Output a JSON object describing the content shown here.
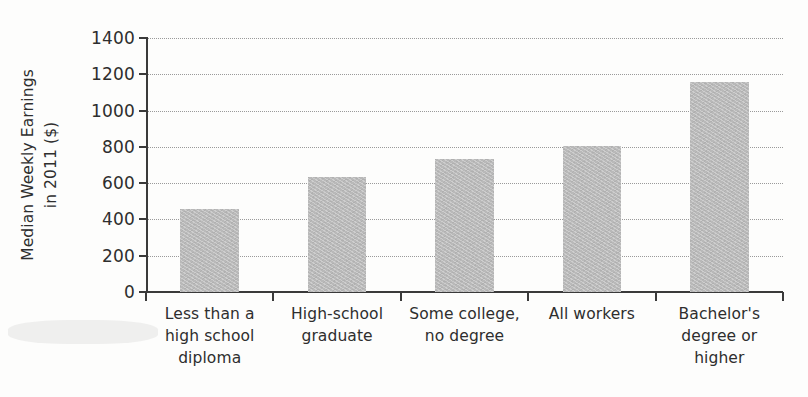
{
  "chart_data": {
    "type": "bar",
    "title": "",
    "subtitle": "",
    "xlabel": "",
    "ylabel": "Median Weekly Earnings in 2011 ($)",
    "ylabel_lines": [
      "Median Weekly Earnings",
      "in 2011 ($)"
    ],
    "categories": [
      "Less than a high school diploma",
      "High-school graduate",
      "Some college, no degree",
      "All workers",
      "Bachelor's degree or higher"
    ],
    "category_label_lines": [
      [
        "Less than a",
        "high school",
        "diploma"
      ],
      [
        "High-school",
        "graduate"
      ],
      [
        "Some college,",
        "no degree"
      ],
      [
        "All workers"
      ],
      [
        "Bachelor's",
        "degree or",
        "higher"
      ]
    ],
    "values": [
      460,
      635,
      735,
      805,
      1160
    ],
    "ylim": [
      0,
      1400
    ],
    "yticks": [
      0,
      200,
      400,
      600,
      800,
      1000,
      1200,
      1400
    ],
    "ytick_labels": [
      "0",
      "200",
      "400",
      "600",
      "800",
      "1000",
      "1200",
      "1400"
    ],
    "grid": true,
    "grid_axis": "y",
    "grid_style": "dotted",
    "legend": false,
    "legend_position": "none",
    "bar_color": "#b9b9b9",
    "axis_color": "#3a3a3a",
    "grid_color": "#9a9a9a",
    "text_color": "#2e2e2e",
    "background_color": "#fdfdfc"
  }
}
